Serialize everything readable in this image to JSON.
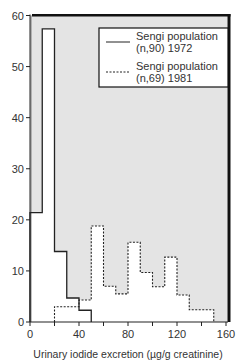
{
  "chart_data": {
    "type": "bar",
    "subtype": "step-histogram",
    "title": "",
    "xlabel": "Urinary iodide excretion (µg/g creatinine)",
    "ylabel": "",
    "xlim": [
      0,
      160
    ],
    "ylim": [
      0,
      60
    ],
    "xticks": [
      0,
      20,
      40,
      60,
      80,
      100,
      120,
      140,
      160
    ],
    "xtick_labels": [
      "0",
      "",
      "40",
      "",
      "80",
      "",
      "120",
      "",
      "160"
    ],
    "yticks": [
      0,
      10,
      20,
      30,
      40,
      50,
      60
    ],
    "ytick_labels": [
      "0",
      "10",
      "20",
      "30",
      "40",
      "50",
      "60"
    ],
    "grid": false,
    "legend_position": "upper right",
    "bin_width": 10,
    "series": [
      {
        "name": "Sengi population (n,90) 1972",
        "legend_line1": "Sengi population",
        "legend_line2": "(n,90) 1972",
        "line_style": "solid",
        "bin_edges": [
          0,
          10,
          20,
          30,
          40,
          50
        ],
        "values": [
          21.4,
          57.4,
          13.8,
          4.7,
          2.3
        ]
      },
      {
        "name": "Sengi population (n,69) 1981",
        "legend_line1": "Sengi population",
        "legend_line2": "(n,69) 1981",
        "line_style": "dashed",
        "bin_edges": [
          20,
          30,
          40,
          50,
          60,
          70,
          80,
          90,
          100,
          110,
          120,
          130,
          140,
          150
        ],
        "values": [
          3.0,
          3.0,
          4.3,
          18.8,
          7.0,
          5.5,
          15.6,
          9.7,
          6.9,
          12.7,
          5.3,
          2.4,
          2.4
        ]
      }
    ]
  },
  "colors": {
    "shade": "#e4e4e4",
    "frame": "#111111",
    "line": "#222222"
  }
}
